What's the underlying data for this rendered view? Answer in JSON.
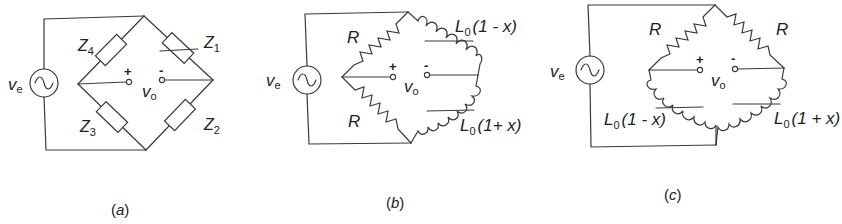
{
  "figure": {
    "panels": [
      {
        "id": "a",
        "caption": "(a)",
        "source_label": "v",
        "source_sub": "e",
        "output_label": "v",
        "output_sub": "o",
        "plus": "+",
        "minus": "-",
        "arms": [
          {
            "name": "Z",
            "sub": "4",
            "position": "upper-left",
            "type": "impedance"
          },
          {
            "name": "Z",
            "sub": "1",
            "position": "upper-right",
            "type": "variable-impedance"
          },
          {
            "name": "Z",
            "sub": "3",
            "position": "lower-left",
            "type": "impedance"
          },
          {
            "name": "Z",
            "sub": "2",
            "position": "lower-right",
            "type": "impedance"
          }
        ]
      },
      {
        "id": "b",
        "caption": "(b)",
        "source_label": "v",
        "source_sub": "e",
        "output_label": "v",
        "output_sub": "o",
        "plus": "+",
        "minus": "-",
        "arms": [
          {
            "name": "R",
            "position": "upper-left",
            "type": "resistor"
          },
          {
            "name": "L",
            "sub": "0",
            "suffix": "(1 - x)",
            "position": "upper-right",
            "type": "inductor"
          },
          {
            "name": "R",
            "position": "lower-left",
            "type": "resistor"
          },
          {
            "name": "L",
            "sub": "0",
            "suffix": "(1+ x)",
            "position": "lower-right",
            "type": "inductor"
          }
        ]
      },
      {
        "id": "c",
        "caption": "(c)",
        "source_label": "v",
        "source_sub": "e",
        "output_label": "v",
        "output_sub": "o",
        "plus": "+",
        "minus": "-",
        "arms": [
          {
            "name": "R",
            "position": "upper-left",
            "type": "resistor"
          },
          {
            "name": "R",
            "position": "upper-right",
            "type": "resistor"
          },
          {
            "name": "L",
            "sub": "0",
            "suffix": "(1 - x)",
            "position": "lower-left",
            "type": "inductor"
          },
          {
            "name": "L",
            "sub": "0",
            "suffix": "(1 + x)",
            "position": "lower-right",
            "type": "inductor"
          }
        ]
      }
    ]
  }
}
